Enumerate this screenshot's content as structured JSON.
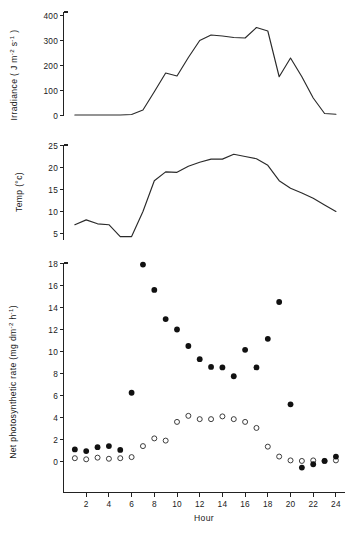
{
  "figure": {
    "title": "",
    "background": "#ffffff",
    "line_color": "#2a2a2a",
    "marker_filled_color": "#111111",
    "marker_open_color": "#ffffff"
  },
  "panels": {
    "irradiance": {
      "ylabel_main": "Irradiance ( J m",
      "ylabel_sup1": "-2",
      "ylabel_mid": " s",
      "ylabel_sup2": "-1",
      "ylabel_end": " )",
      "yticks": [
        "0",
        "100",
        "200",
        "300",
        "400"
      ]
    },
    "temperature": {
      "ylabel": "Temp (°c)",
      "yticks": [
        "5",
        "10",
        "15",
        "20",
        "25"
      ]
    },
    "photosynthesis": {
      "ylabel_main": "Net photosynthetic rate (mg dm",
      "ylabel_sup1": "-2",
      "ylabel_mid": " h",
      "ylabel_sup2": "-1",
      "ylabel_end": ")",
      "yticks": [
        "0",
        "2",
        "4",
        "6",
        "8",
        "10",
        "12",
        "14",
        "16",
        "18"
      ],
      "xlabel": "Hour",
      "xticks": [
        "2",
        "4",
        "6",
        "8",
        "10",
        "12",
        "14",
        "16",
        "18",
        "20",
        "22",
        "24"
      ]
    }
  },
  "chart_data": [
    {
      "type": "line",
      "title": "Irradiance diurnal course",
      "xlabel": "Hour",
      "ylabel": "Irradiance ( J m-2 s-1 )",
      "xlim": [
        0,
        24.8
      ],
      "ylim": [
        0,
        400
      ],
      "xticks": [
        2,
        4,
        6,
        8,
        10,
        12,
        14,
        16,
        18,
        20,
        22,
        24
      ],
      "yticks": [
        0,
        100,
        200,
        300,
        400
      ],
      "grid": false,
      "legend": "none",
      "x": [
        1,
        2,
        3,
        4,
        5,
        6,
        7,
        8,
        9,
        10,
        11,
        12,
        13,
        14,
        15,
        16,
        17,
        18,
        19,
        20,
        21,
        22,
        23,
        24
      ],
      "values": [
        2,
        2,
        2,
        2,
        2,
        4,
        22,
        95,
        170,
        158,
        232,
        300,
        322,
        318,
        312,
        310,
        352,
        338,
        155,
        230,
        155,
        70,
        8,
        5
      ]
    },
    {
      "type": "line",
      "title": "Air temperature diurnal course",
      "xlabel": "Hour",
      "ylabel": "Temp (°c)",
      "xlim": [
        0,
        24.8
      ],
      "ylim": [
        3.5,
        25
      ],
      "xticks": [
        2,
        4,
        6,
        8,
        10,
        12,
        14,
        16,
        18,
        20,
        22,
        24
      ],
      "yticks": [
        5,
        10,
        15,
        20,
        25
      ],
      "grid": false,
      "legend": "none",
      "x": [
        1,
        2,
        3,
        4,
        5,
        6,
        7,
        8,
        9,
        10,
        11,
        12,
        13,
        14,
        15,
        16,
        17,
        18,
        19,
        20,
        21,
        22,
        23,
        24
      ],
      "values": [
        7.0,
        8.1,
        7.2,
        7.0,
        4.3,
        4.3,
        10.0,
        17.0,
        19.0,
        18.9,
        20.3,
        21.2,
        21.9,
        21.9,
        23.0,
        22.5,
        22.0,
        20.5,
        17.0,
        15.3,
        14.2,
        13.0,
        11.5,
        10.0
      ]
    },
    {
      "type": "scatter",
      "title": "Net photosynthetic rate diurnal course",
      "xlabel": "Hour",
      "ylabel": "Net photosynthetic rate (mg dm-2 h-1)",
      "xlim": [
        0,
        24.8
      ],
      "ylim": [
        -1.2,
        18.6
      ],
      "xticks": [
        2,
        4,
        6,
        8,
        10,
        12,
        14,
        16,
        18,
        20,
        22,
        24
      ],
      "yticks": [
        0,
        2,
        4,
        6,
        8,
        10,
        12,
        14,
        16,
        18
      ],
      "grid": false,
      "legend": "none",
      "x": [
        1,
        2,
        3,
        4,
        5,
        6,
        7,
        8,
        9,
        10,
        11,
        12,
        13,
        14,
        15,
        16,
        17,
        18,
        19,
        20,
        21,
        22,
        23,
        24
      ],
      "series": [
        {
          "name": "filled-circles",
          "marker": "filled",
          "values": [
            1.1,
            0.95,
            1.3,
            1.4,
            1.05,
            6.25,
            17.9,
            15.6,
            12.95,
            12.0,
            10.5,
            9.3,
            8.6,
            8.55,
            7.75,
            10.15,
            8.55,
            11.15,
            14.5,
            5.2,
            -0.55,
            -0.25,
            0.05,
            0.45
          ]
        },
        {
          "name": "open-circles",
          "marker": "open",
          "values": [
            0.3,
            0.2,
            0.35,
            0.25,
            0.3,
            0.4,
            1.4,
            2.1,
            1.9,
            3.6,
            4.15,
            3.85,
            3.85,
            4.1,
            3.85,
            3.6,
            3.05,
            1.35,
            0.45,
            0.1,
            0.05,
            0.1,
            0.05,
            0.1
          ]
        }
      ]
    }
  ]
}
